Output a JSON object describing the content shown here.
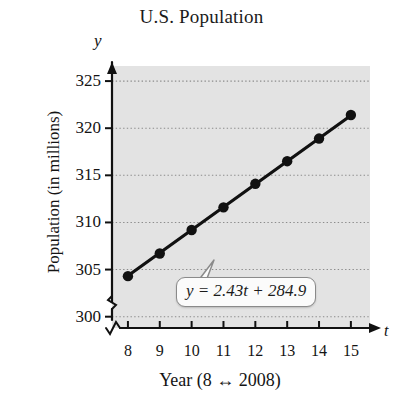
{
  "chart_data": {
    "type": "scatter",
    "title": "U.S. Population",
    "xlabel": "Year (8 ↔ 2008)",
    "ylabel": "Population (in millions)",
    "x_axis_variable": "t",
    "y_axis_variable": "y",
    "x": [
      8,
      9,
      10,
      11,
      12,
      13,
      14,
      15
    ],
    "values": [
      304.3,
      306.7,
      309.2,
      311.6,
      314.1,
      316.5,
      318.9,
      321.4
    ],
    "series": [
      {
        "name": "U.S. Population",
        "values": [
          304.3,
          306.7,
          309.2,
          311.6,
          314.1,
          316.5,
          318.9,
          321.4
        ]
      }
    ],
    "xtick_labels": [
      "8",
      "9",
      "10",
      "11",
      "12",
      "13",
      "14",
      "15"
    ],
    "ytick_labels": [
      "300",
      "305",
      "310",
      "315",
      "320",
      "325"
    ],
    "xlim": [
      7.5,
      15.6
    ],
    "ylim": [
      298.8,
      326.6
    ],
    "grid": "horizontal-dotted",
    "legend": "none",
    "y_axis_break": true,
    "x_axis_break": true,
    "annotation": {
      "text": "y = 2.43t + 284.9",
      "equation_lhs": "y",
      "equation_rhs": "2.43t + 284.9",
      "slope": 2.43,
      "intercept": 284.9,
      "points_to": "trend-line"
    },
    "trend_line": {
      "type": "linear",
      "slope": 2.43,
      "intercept": 284.9,
      "from_x": 8,
      "to_x": 15
    },
    "colors": {
      "plot_background": "#e3e3e3",
      "marker": "#111111",
      "line": "#111111",
      "gridline": "#8c8c8c",
      "axis": "#111111",
      "callout_fill": "#fbfbfb",
      "callout_border": "#8a8a8a",
      "text": "#141414"
    }
  }
}
